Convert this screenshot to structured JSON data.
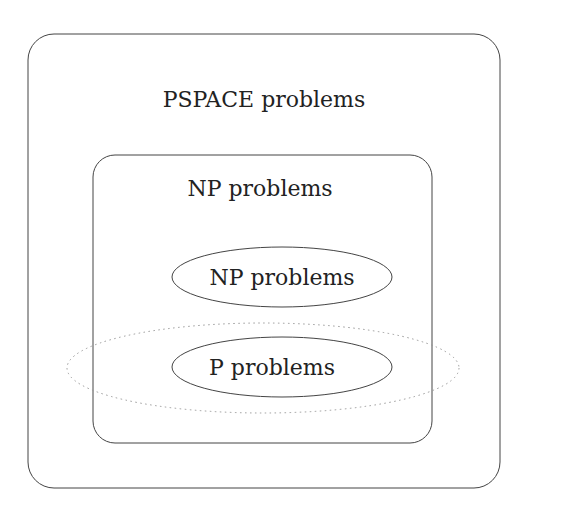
{
  "diagram": {
    "outer_box": {
      "label": "PSPACE problems"
    },
    "inner_box": {
      "label": "NP problems"
    },
    "np_ellipse": {
      "label": "NP problems"
    },
    "p_ellipse": {
      "label": "P problems"
    },
    "dotted_ellipse": {
      "label": ""
    }
  },
  "colors": {
    "stroke": "#444444",
    "dotted_stroke": "#999999",
    "text": "#222222",
    "background": "#ffffff"
  }
}
